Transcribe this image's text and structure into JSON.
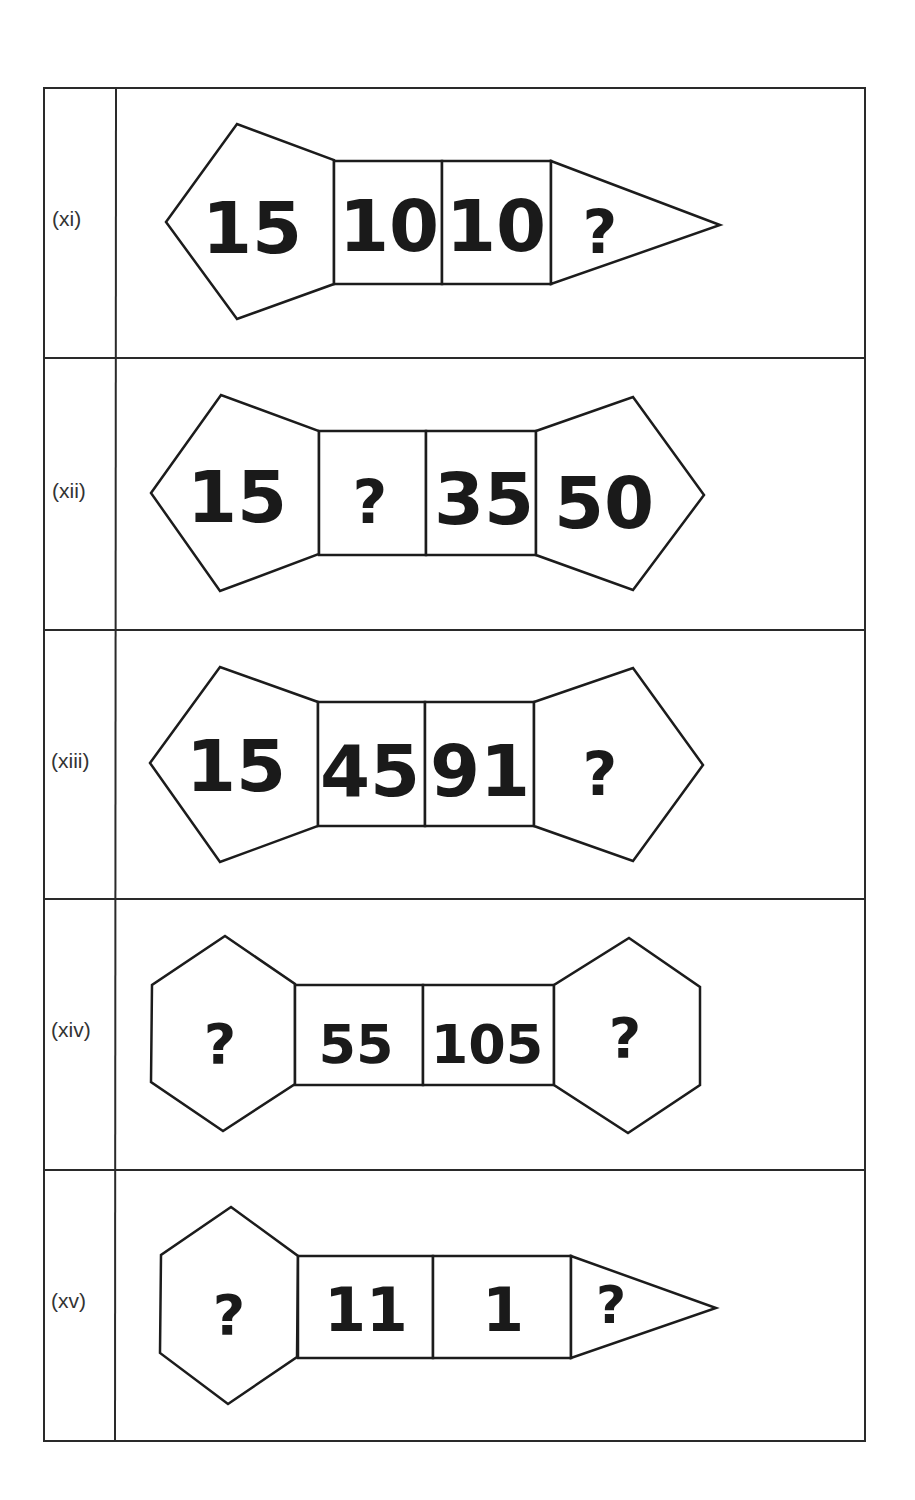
{
  "rows": [
    {
      "label": "(xi)",
      "cells": [
        "15",
        "10",
        "10",
        "?"
      ],
      "shapes": [
        "pentagon-left",
        "square",
        "square",
        "triangle-right"
      ]
    },
    {
      "label": "(xii)",
      "cells": [
        "15",
        "?",
        "35",
        "50"
      ],
      "shapes": [
        "pentagon-left",
        "square",
        "square",
        "pentagon-right"
      ]
    },
    {
      "label": "(xiii)",
      "cells": [
        "15",
        "45",
        "91",
        "?"
      ],
      "shapes": [
        "pentagon-left",
        "square",
        "square",
        "pentagon-right"
      ]
    },
    {
      "label": "(xiv)",
      "cells": [
        "?",
        "55",
        "105",
        "?"
      ],
      "shapes": [
        "hexagon",
        "square",
        "square",
        "hexagon"
      ]
    },
    {
      "label": "(xv)",
      "cells": [
        "?",
        "11",
        "1",
        "?"
      ],
      "shapes": [
        "hexagon",
        "square",
        "square",
        "triangle-right"
      ]
    }
  ],
  "colors": {
    "line": "#1c1c1c",
    "text": "#1a1a1a",
    "background": "#ffffff"
  }
}
